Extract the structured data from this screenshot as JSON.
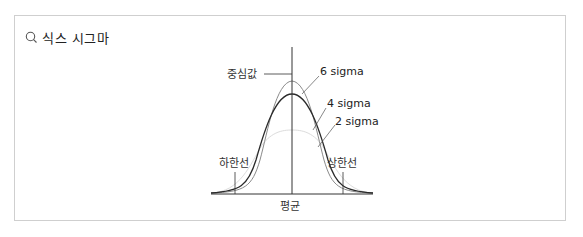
{
  "header": {
    "icon": "search-icon",
    "title": "식스 시그마"
  },
  "diagram": {
    "labels": {
      "center_value": "중심값",
      "six_sigma": "6 sigma",
      "four_sigma": "4 sigma",
      "two_sigma": "2 sigma",
      "lower_limit": "하한선",
      "upper_limit": "상한선",
      "mean": "평균"
    },
    "colors": {
      "six_sigma": "#8a8a8a",
      "four_sigma": "#2a2a2a",
      "two_sigma": "#dcdcdc",
      "axis": "#333333"
    }
  }
}
